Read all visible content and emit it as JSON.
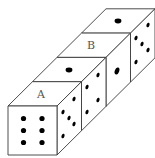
{
  "figure": {
    "colors": {
      "background": "#ffffff",
      "edge": "#3a3a3a",
      "pip": "#000000",
      "label": "#555555"
    }
  },
  "dice": [
    {
      "index": 1,
      "front": 6,
      "top": "A",
      "right": 5
    },
    {
      "index": 2,
      "top": 1,
      "right": 4
    },
    {
      "index": 3,
      "top": "B",
      "right": 1
    },
    {
      "index": 4,
      "top": 1,
      "right": 5
    }
  ],
  "labels": {
    "a": "A",
    "b": "B"
  }
}
